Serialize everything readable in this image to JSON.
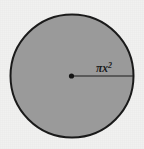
{
  "figure": {
    "name": "circle-area-diagram",
    "canvas": {
      "width": 144,
      "height": 149
    },
    "background_color": "#f1f1f0",
    "circle": {
      "center_x": 72,
      "center_y": 76,
      "radius": 61.5,
      "fill_color": "#9a9a9a",
      "stroke_color": "#1a1a1a",
      "stroke_width": 2
    },
    "center_dot": {
      "center_x": 71.5,
      "center_y": 76,
      "radius": 2.6,
      "color": "#141414"
    },
    "radius_line": {
      "x1": 71.5,
      "y1": 76,
      "x2": 133.5,
      "y2": 76,
      "color": "#1a1a1a",
      "stroke_width": 1.1
    },
    "radius_label": {
      "base_text": "πx",
      "exponent_text": "2",
      "full_text": "πx²",
      "x": 96,
      "y": 72,
      "color": "#1b1b1b"
    }
  }
}
